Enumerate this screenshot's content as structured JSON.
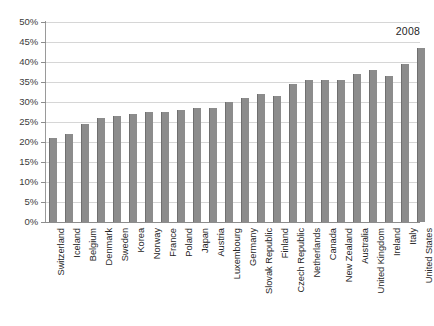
{
  "chart_data": {
    "type": "bar",
    "title": "",
    "subtitle": "",
    "xlabel": "",
    "ylabel": "",
    "ylim": [
      0,
      50
    ],
    "ytick_step": 5,
    "ytick_suffix": "%",
    "grid": true,
    "legend": false,
    "legend_position": "none",
    "annotations": [
      {
        "text": "2008",
        "target": "United States",
        "position": "above-last-bar"
      }
    ],
    "ytick_labels": [
      "50%",
      "45%",
      "40%",
      "35%",
      "30%",
      "25%",
      "20%",
      "15%",
      "10%",
      "5%",
      "0%"
    ],
    "ytick_values": [
      50,
      45,
      40,
      35,
      30,
      25,
      20,
      15,
      10,
      5,
      0
    ],
    "bar_color": "#8c8c8c",
    "categories": [
      "Switzerland",
      "Iceland",
      "Belgium",
      "Denmark",
      "Sweden",
      "Korea",
      "Norway",
      "France",
      "Poland",
      "Japan",
      "Austria",
      "Luxembourg",
      "Germany",
      "Slovak Republic",
      "Finland",
      "Czech Republic",
      "Netherlands",
      "Canada",
      "New Zealand",
      "Australia",
      "United Kingdom",
      "Ireland",
      "Italy",
      "United States"
    ],
    "series": [
      {
        "name": "2008",
        "values": [
          21.0,
          22.0,
          24.5,
          26.0,
          26.5,
          27.0,
          27.5,
          27.5,
          28.0,
          28.5,
          28.5,
          30.0,
          31.0,
          32.0,
          31.5,
          34.5,
          35.5,
          35.5,
          35.5,
          37.0,
          38.0,
          36.5,
          39.5,
          43.5
        ]
      }
    ]
  }
}
